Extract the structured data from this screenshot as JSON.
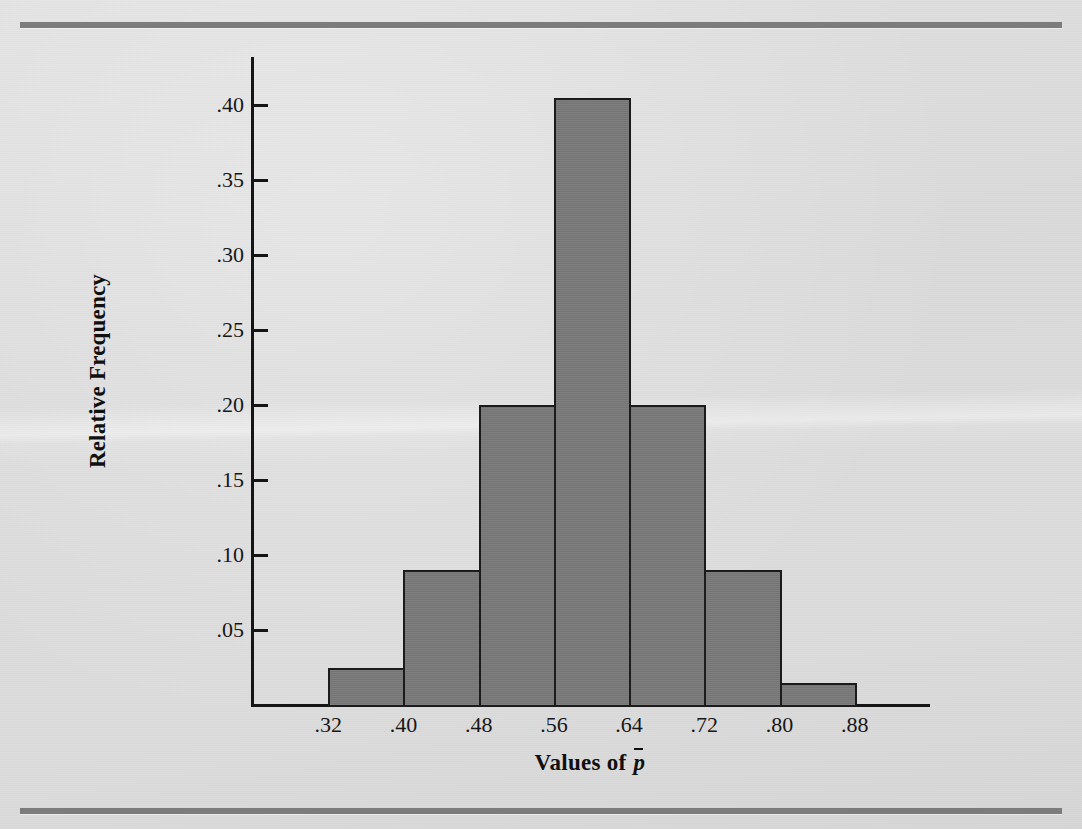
{
  "figure": {
    "background_color": "#dcdcdc",
    "bar_fill_color": "#787878",
    "axis_color": "#151515",
    "rule_color": "#7c7c7c"
  },
  "chart_data": {
    "type": "bar",
    "title": "",
    "subtitle": "",
    "xlabel": "Values of p̄",
    "xlabel_prefix": "Values of ",
    "xlabel_symbol": "p",
    "ylabel": "Relative Frequency",
    "categories": [
      ".32–.40",
      ".40–.48",
      ".48–.56",
      ".56–.64",
      ".64–.72",
      ".72–.80",
      ".80–.88"
    ],
    "bin_edges": [
      0.32,
      0.4,
      0.48,
      0.56,
      0.64,
      0.72,
      0.8,
      0.88
    ],
    "values": [
      0.025,
      0.09,
      0.2,
      0.405,
      0.2,
      0.09,
      0.015
    ],
    "xlim": [
      0.24,
      0.96
    ],
    "ylim": [
      0,
      0.42
    ],
    "xticks": [
      ".32",
      ".40",
      ".48",
      ".56",
      ".64",
      ".72",
      ".80",
      ".88"
    ],
    "xtick_values": [
      0.32,
      0.4,
      0.48,
      0.56,
      0.64,
      0.72,
      0.8,
      0.88
    ],
    "yticks": [
      ".05",
      ".10",
      ".15",
      ".20",
      ".25",
      ".30",
      ".35",
      ".40"
    ],
    "ytick_values": [
      0.05,
      0.1,
      0.15,
      0.2,
      0.25,
      0.3,
      0.35,
      0.4
    ],
    "grid": false,
    "legend": null,
    "legend_position": "none",
    "annotations": []
  }
}
